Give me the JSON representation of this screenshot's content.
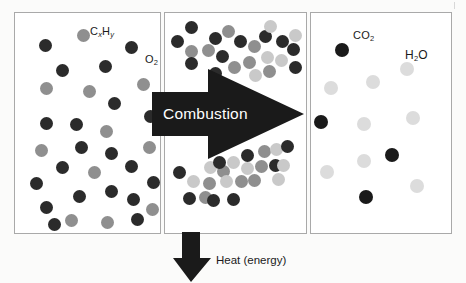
{
  "figure": {
    "background_color": "#fbfbfa",
    "panel_border_color": "#a9a9a9"
  },
  "colors": {
    "dark": "#2b2b2b",
    "black": "#1a1a1a",
    "medium_gray": "#8f8f8f",
    "light_gray": "#c9c9c9",
    "pale_gray": "#dcdcdc",
    "arrow": "#1a1a1a",
    "arrow_text": "#ffffff",
    "text": "#1a1a1a"
  },
  "panels": {
    "reactants": {
      "name": "reactants-panel",
      "labels": [
        {
          "id": "cxhy",
          "text_main": "C",
          "sub1": "x",
          "text_mid": "H",
          "sub2": "y",
          "x": 75,
          "y": 13
        },
        {
          "id": "o2",
          "text_main": "O",
          "sub1": "2",
          "x": 130,
          "y": 41
        }
      ],
      "molecules": [
        {
          "c": "dark",
          "x": 24,
          "y": 26,
          "d": 13
        },
        {
          "c": "medium",
          "x": 62,
          "y": 16,
          "d": 13
        },
        {
          "c": "dark",
          "x": 110,
          "y": 28,
          "d": 13
        },
        {
          "c": "dark",
          "x": 41,
          "y": 51,
          "d": 13
        },
        {
          "c": "dark",
          "x": 84,
          "y": 47,
          "d": 13
        },
        {
          "c": "medium",
          "x": 25,
          "y": 69,
          "d": 13
        },
        {
          "c": "medium",
          "x": 68,
          "y": 72,
          "d": 13
        },
        {
          "c": "medium",
          "x": 122,
          "y": 65,
          "d": 13
        },
        {
          "c": "dark",
          "x": 93,
          "y": 84,
          "d": 13
        },
        {
          "c": "dark",
          "x": 129,
          "y": 97,
          "d": 13
        },
        {
          "c": "dark",
          "x": 25,
          "y": 104,
          "d": 13
        },
        {
          "c": "dark",
          "x": 55,
          "y": 105,
          "d": 13
        },
        {
          "c": "medium",
          "x": 85,
          "y": 112,
          "d": 13
        },
        {
          "c": "medium",
          "x": 20,
          "y": 131,
          "d": 13
        },
        {
          "c": "dark",
          "x": 60,
          "y": 128,
          "d": 13
        },
        {
          "c": "dark",
          "x": 90,
          "y": 134,
          "d": 13
        },
        {
          "c": "medium",
          "x": 128,
          "y": 128,
          "d": 13
        },
        {
          "c": "dark",
          "x": 41,
          "y": 148,
          "d": 13
        },
        {
          "c": "medium",
          "x": 73,
          "y": 153,
          "d": 13
        },
        {
          "c": "dark",
          "x": 110,
          "y": 147,
          "d": 13
        },
        {
          "c": "dark",
          "x": 15,
          "y": 164,
          "d": 13
        },
        {
          "c": "dark",
          "x": 132,
          "y": 163,
          "d": 13
        },
        {
          "c": "dark",
          "x": 58,
          "y": 177,
          "d": 13
        },
        {
          "c": "dark",
          "x": 90,
          "y": 172,
          "d": 13
        },
        {
          "c": "dark",
          "x": 112,
          "y": 180,
          "d": 13
        },
        {
          "c": "dark",
          "x": 25,
          "y": 188,
          "d": 13
        },
        {
          "c": "medium",
          "x": 131,
          "y": 190,
          "d": 13
        },
        {
          "c": "dark",
          "x": 33,
          "y": 205,
          "d": 13
        },
        {
          "c": "medium",
          "x": 50,
          "y": 201,
          "d": 13
        },
        {
          "c": "medium",
          "x": 86,
          "y": 203,
          "d": 13
        },
        {
          "c": "dark",
          "x": 116,
          "y": 200,
          "d": 13
        }
      ]
    },
    "reaction": {
      "name": "reaction-panel",
      "arrow_label": "Combustion",
      "molecules_top": [
        {
          "c": "dark",
          "x": 20,
          "y": 8,
          "d": 13
        },
        {
          "c": "dark",
          "x": 44,
          "y": 19,
          "d": 13
        },
        {
          "c": "medium",
          "x": 57,
          "y": 12,
          "d": 13
        },
        {
          "c": "dark",
          "x": 6,
          "y": 22,
          "d": 13
        },
        {
          "c": "medium",
          "x": 20,
          "y": 32,
          "d": 13
        },
        {
          "c": "dark",
          "x": 69,
          "y": 22,
          "d": 13
        },
        {
          "c": "medium",
          "x": 83,
          "y": 27,
          "d": 13
        },
        {
          "c": "dark",
          "x": 94,
          "y": 17,
          "d": 13
        },
        {
          "c": "light",
          "x": 99,
          "y": 7,
          "d": 13
        },
        {
          "c": "medium",
          "x": 37,
          "y": 31,
          "d": 13
        },
        {
          "c": "dark",
          "x": 51,
          "y": 37,
          "d": 13
        },
        {
          "c": "dark",
          "x": 111,
          "y": 22,
          "d": 13
        },
        {
          "c": "light",
          "x": 124,
          "y": 16,
          "d": 13
        },
        {
          "c": "dark",
          "x": 20,
          "y": 44,
          "d": 13
        },
        {
          "c": "dark",
          "x": 122,
          "y": 30,
          "d": 13
        },
        {
          "c": "medium",
          "x": 63,
          "y": 48,
          "d": 13
        },
        {
          "c": "medium",
          "x": 78,
          "y": 43,
          "d": 13
        },
        {
          "c": "light",
          "x": 96,
          "y": 38,
          "d": 13
        },
        {
          "c": "light",
          "x": 110,
          "y": 41,
          "d": 13
        },
        {
          "c": "dark",
          "x": 44,
          "y": 54,
          "d": 13
        },
        {
          "c": "dark",
          "x": 124,
          "y": 48,
          "d": 13
        },
        {
          "c": "light",
          "x": 84,
          "y": 56,
          "d": 13
        },
        {
          "c": "medium",
          "x": 98,
          "y": 52,
          "d": 13
        }
      ],
      "molecules_bottom": [
        {
          "c": "dark",
          "x": 76,
          "y": 136,
          "d": 13
        },
        {
          "c": "medium",
          "x": 93,
          "y": 132,
          "d": 13
        },
        {
          "c": "light",
          "x": 105,
          "y": 130,
          "d": 13
        },
        {
          "c": "dark",
          "x": 116,
          "y": 127,
          "d": 13
        },
        {
          "c": "light",
          "x": 39,
          "y": 148,
          "d": 13
        },
        {
          "c": "medium",
          "x": 52,
          "y": 152,
          "d": 13
        },
        {
          "c": "dark",
          "x": 48,
          "y": 143,
          "d": 13
        },
        {
          "c": "light",
          "x": 62,
          "y": 143,
          "d": 13
        },
        {
          "c": "light",
          "x": 76,
          "y": 149,
          "d": 13
        },
        {
          "c": "medium",
          "x": 90,
          "y": 147,
          "d": 13
        },
        {
          "c": "dark",
          "x": 104,
          "y": 146,
          "d": 13
        },
        {
          "c": "light",
          "x": 112,
          "y": 146,
          "d": 13
        },
        {
          "c": "dark",
          "x": 8,
          "y": 153,
          "d": 13
        },
        {
          "c": "light",
          "x": 22,
          "y": 162,
          "d": 13
        },
        {
          "c": "medium",
          "x": 38,
          "y": 164,
          "d": 13
        },
        {
          "c": "light",
          "x": 55,
          "y": 162,
          "d": 13
        },
        {
          "c": "medium",
          "x": 70,
          "y": 162,
          "d": 13
        },
        {
          "c": "medium",
          "x": 83,
          "y": 161,
          "d": 13
        },
        {
          "c": "light",
          "x": 107,
          "y": 160,
          "d": 13
        },
        {
          "c": "dark",
          "x": 18,
          "y": 179,
          "d": 13
        },
        {
          "c": "medium",
          "x": 34,
          "y": 178,
          "d": 13
        },
        {
          "c": "dark",
          "x": 42,
          "y": 181,
          "d": 13
        },
        {
          "c": "dark",
          "x": 62,
          "y": 180,
          "d": 13
        }
      ]
    },
    "products": {
      "name": "products-panel",
      "labels": [
        {
          "id": "co2",
          "text_main": "CO",
          "sub1": "2",
          "x": 42,
          "y": 17
        },
        {
          "id": "h2o",
          "text_main": "H",
          "sub1": "2",
          "text_mid": "O",
          "x": 94,
          "y": 36
        }
      ],
      "molecules": [
        {
          "c": "black",
          "x": 24,
          "y": 30,
          "d": 14
        },
        {
          "c": "pale",
          "x": 89,
          "y": 49,
          "d": 14
        },
        {
          "c": "pale",
          "x": 55,
          "y": 62,
          "d": 14
        },
        {
          "c": "pale",
          "x": 13,
          "y": 68,
          "d": 14
        },
        {
          "c": "black",
          "x": 3,
          "y": 102,
          "d": 14
        },
        {
          "c": "pale",
          "x": 46,
          "y": 104,
          "d": 14
        },
        {
          "c": "pale",
          "x": 95,
          "y": 98,
          "d": 14
        },
        {
          "c": "black",
          "x": 74,
          "y": 135,
          "d": 14
        },
        {
          "c": "pale",
          "x": 46,
          "y": 141,
          "d": 14
        },
        {
          "c": "pale",
          "x": 9,
          "y": 152,
          "d": 14
        },
        {
          "c": "pale",
          "x": 99,
          "y": 166,
          "d": 14
        },
        {
          "c": "black",
          "x": 48,
          "y": 177,
          "d": 14
        }
      ]
    }
  },
  "annotations": {
    "heat_label": "Heat (energy)"
  }
}
